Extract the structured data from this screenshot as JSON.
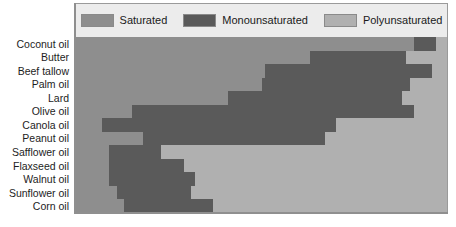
{
  "chart_data": {
    "type": "bar",
    "orientation": "horizontal",
    "stacked": true,
    "normalized": "100%",
    "title": "",
    "subtitle": "",
    "xlabel": "",
    "ylabel": "",
    "xlim": [
      0,
      100
    ],
    "grid": false,
    "legend_position": "top",
    "categories": [
      "Coconut oil",
      "Butter",
      "Beef tallow",
      "Palm oil",
      "Lard",
      "Olive oil",
      "Canola oil",
      "Peanut oil",
      "Safflower oil",
      "Flaxseed oil",
      "Walnut oil",
      "Sunflower oil",
      "Corn oil"
    ],
    "series": [
      {
        "name": "Saturated",
        "color": "#8e8e8e",
        "values": [
          91,
          63,
          51,
          50,
          41,
          15,
          7,
          18,
          9,
          9,
          9,
          11,
          13
        ]
      },
      {
        "name": "Monounsaturated",
        "color": "#5a5a5a",
        "values": [
          6,
          26,
          45,
          40,
          47,
          76,
          63,
          49,
          14,
          20,
          23,
          20,
          24
        ]
      },
      {
        "name": "Polyunsaturated",
        "color": "#b0b0b0",
        "values": [
          3,
          11,
          4,
          10,
          12,
          9,
          30,
          33,
          77,
          71,
          68,
          69,
          63
        ]
      }
    ]
  },
  "legend": {
    "entries": [
      {
        "label": "Saturated",
        "color": "#8e8e8e"
      },
      {
        "label": "Monounsaturated",
        "color": "#5a5a5a"
      },
      {
        "label": "Polyunsaturated",
        "color": "#b0b0b0"
      }
    ]
  },
  "colors": {
    "saturated": "#8e8e8e",
    "monounsaturated": "#5a5a5a",
    "polyunsaturated": "#b0b0b0",
    "panel_background": "#ececec",
    "panel_border": "#9a9a9a",
    "page_background": "#ffffff",
    "label_text": "#1d1d1d"
  }
}
